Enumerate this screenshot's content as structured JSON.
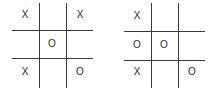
{
  "boards": [
    {
      "cells": [
        [
          "X",
          "",
          "X"
        ],
        [
          "",
          "O",
          ""
        ],
        [
          "X",
          "",
          "O"
        ]
      ]
    },
    {
      "cells": [
        [
          "X",
          "",
          ""
        ],
        [
          "O",
          "O",
          ""
        ],
        [
          "X",
          "",
          "O"
        ]
      ]
    }
  ]
}
